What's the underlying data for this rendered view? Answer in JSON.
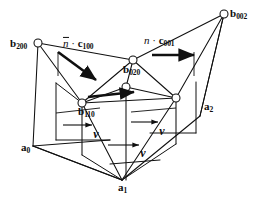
{
  "figure": {
    "type": "geometric-diagram",
    "background_color": "#ffffff",
    "line_color": "#101010",
    "node_fill": "#ffffff"
  },
  "vertices": [
    {
      "id": "b200",
      "base": "b",
      "sub": "200",
      "label_x": 10,
      "label_y": 44,
      "node_x": 38,
      "node_y": 43
    },
    {
      "id": "b002",
      "base": "b",
      "sub": "002",
      "label_x": 230,
      "label_y": 14,
      "node_x": 224,
      "node_y": 14
    },
    {
      "id": "b020",
      "base": "b",
      "sub": "020",
      "label_x": 123,
      "label_y": 70,
      "node_x": 126,
      "node_y": 87
    },
    {
      "id": "b110",
      "base": "b",
      "sub": "110",
      "label_x": 78,
      "label_y": 112,
      "node_x": 82,
      "node_y": 103
    },
    {
      "id": "a0",
      "base": "a",
      "sub": "0",
      "label_x": 21,
      "label_y": 148,
      "node_x": 33,
      "node_y": 146
    },
    {
      "id": "a1",
      "base": "a",
      "sub": "1",
      "label_x": 118,
      "label_y": 188,
      "node_x": 122,
      "node_y": 180
    },
    {
      "id": "a2",
      "base": "a",
      "sub": "2",
      "label_x": 204,
      "label_y": 107,
      "node_x": 200,
      "node_y": 116
    }
  ],
  "vector_labels": [
    {
      "id": "nc100",
      "prefix": "n",
      "overbar": true,
      "dot": "·",
      "base": "c",
      "sub": "100",
      "x": 63,
      "y": 44
    },
    {
      "id": "nc001",
      "prefix": "n",
      "overbar": false,
      "dot": "·",
      "base": "c",
      "sub": "001",
      "x": 144,
      "y": 41
    }
  ],
  "v_labels": [
    {
      "id": "v-left",
      "text": "v",
      "x": 96,
      "y": 134
    },
    {
      "id": "v-right",
      "text": "v",
      "x": 162,
      "y": 131
    },
    {
      "id": "v-bottom",
      "text": "v",
      "x": 143,
      "y": 153
    }
  ]
}
